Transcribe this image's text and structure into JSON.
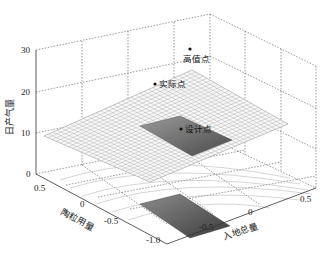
{
  "chart_data": {
    "type": "surface3d",
    "title": "",
    "zlabel": "日产气量",
    "ylabel": "陶粒用量",
    "xlabel": "入地总量",
    "z_ticks": [
      "0",
      "10",
      "20",
      "30"
    ],
    "zlim": [
      0,
      30
    ],
    "y_ticks": [
      "0.5",
      "0",
      "-0.5",
      "-1.0"
    ],
    "x_ticks": [
      "-0.5",
      "0",
      "0.5"
    ],
    "grid": true,
    "points": [
      {
        "label": "高值点",
        "x": 0.5,
        "y": 0.5,
        "z_estimate": 27
      },
      {
        "label": "实际点",
        "x": -0.2,
        "y": 0.3,
        "z_estimate": 23
      },
      {
        "label": "设计点",
        "x": 0.0,
        "y": -0.5,
        "z_estimate": 16
      }
    ]
  },
  "labels": {
    "z_axis": "日产气量",
    "y_axis": "陶粒用量",
    "x_axis": "入地总量",
    "z_ticks": [
      "30",
      "20",
      "10",
      "0"
    ],
    "y_ticks": [
      "0.5",
      "0",
      "-0.5",
      "-1.0"
    ],
    "x_ticks": [
      "-0.5",
      "0",
      "0.5"
    ],
    "points": [
      "高值点",
      "实际点",
      "设计点"
    ]
  },
  "colors": {
    "mesh": "#8a8a8a",
    "surface_fill": "#f7f7f7",
    "region_fill": "#6e6e6e",
    "axes": "#333333",
    "grid": "#555555"
  }
}
